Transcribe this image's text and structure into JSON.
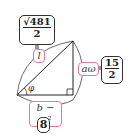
{
  "diagram": {
    "type": "right triangle inscribed in arcs",
    "labels": {
      "hypotenuse": "l",
      "vertical_leg": "aω",
      "horizontal_leg": "b − ω²",
      "angle": "φ"
    },
    "values": {
      "hypotenuse": {
        "numerator": "√481",
        "denominator": "2"
      },
      "vertical_leg": {
        "numerator": "15",
        "denominator": "2"
      },
      "horizontal_leg": "8"
    },
    "colors": {
      "label_border": "#e07aa0",
      "value_border": "#333333",
      "lines": "#333333"
    }
  }
}
